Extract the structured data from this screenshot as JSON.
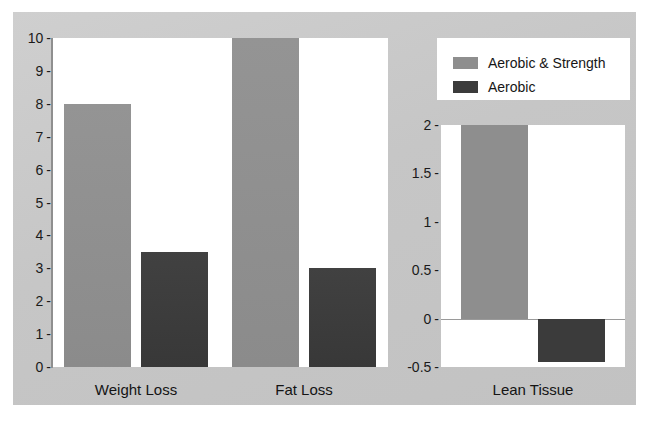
{
  "chart_data": {
    "type": "bar",
    "title": "",
    "subtitle": "",
    "xlabel": "",
    "ylabel": "",
    "legend_position": "top-right",
    "grid": false,
    "panels": [
      {
        "name": "left-panel",
        "categories": [
          "Weight Loss",
          "Fat Loss"
        ],
        "ylim": [
          0,
          10
        ],
        "yticks": [
          "0",
          "1",
          "2",
          "3",
          "4",
          "5",
          "6",
          "7",
          "8",
          "9",
          "10"
        ],
        "ytick_values": [
          0,
          1,
          2,
          3,
          4,
          5,
          6,
          7,
          8,
          9,
          10
        ],
        "series": [
          {
            "name": "Aerobic & Strength",
            "color": "#8e8e8e",
            "values": [
              8,
              10
            ]
          },
          {
            "name": "Aerobic",
            "color": "#3b3b3b",
            "values": [
              3.5,
              3
            ]
          }
        ]
      },
      {
        "name": "right-panel",
        "categories": [
          "Lean Tissue"
        ],
        "ylim": [
          -0.5,
          2
        ],
        "yticks": [
          "-0.5",
          "0",
          "0.5",
          "1",
          "1.5",
          "2"
        ],
        "ytick_values": [
          -0.5,
          0,
          0.5,
          1,
          1.5,
          2
        ],
        "series": [
          {
            "name": "Aerobic & Strength",
            "color": "#8e8e8e",
            "values": [
              2
            ]
          },
          {
            "name": "Aerobic",
            "color": "#3b3b3b",
            "values": [
              -0.45
            ]
          }
        ]
      }
    ]
  },
  "legend": {
    "entries": [
      {
        "label": "Aerobic & Strength",
        "color": "#8e8e8e"
      },
      {
        "label": "Aerobic",
        "color": "#3b3b3b"
      }
    ]
  },
  "colors": {
    "panel_background": "#c9c9c9",
    "plot_background": "#ffffff",
    "series_light": "#8e8e8e",
    "series_dark": "#3b3b3b",
    "axis": "#8f8f8f",
    "text": "#1a1a1a"
  }
}
